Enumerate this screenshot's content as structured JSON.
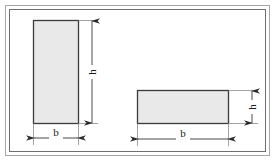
{
  "figure": {
    "frame": {
      "outer_border_color": "#9a9a9a",
      "inner_border_color": "#7d7d7d",
      "background_color": "#ffffff"
    },
    "colors": {
      "shape_fill": "#e9e9e9",
      "shape_stroke": "#3b3b3b",
      "dimension_line": "#4a4a4a",
      "label_text": "#1a1a1a"
    },
    "shapes": [
      {
        "name": "tall-rectangle",
        "x": 33,
        "y": 20,
        "width": 45,
        "height": 103,
        "width_label": "b",
        "height_label": "h"
      },
      {
        "name": "wide-rectangle",
        "x": 137,
        "y": 90,
        "width": 91,
        "height": 33,
        "width_label": "b",
        "height_label": "h"
      }
    ],
    "dimensions": [
      {
        "name": "tall-height",
        "label": "h",
        "orientation": "vertical",
        "x": 92,
        "y1": 20,
        "y2": 123
      },
      {
        "name": "tall-width",
        "label": "b",
        "orientation": "horizontal",
        "y": 138,
        "x1": 33,
        "x2": 78
      },
      {
        "name": "wide-height",
        "label": "h",
        "orientation": "vertical",
        "x": 252,
        "y1": 90,
        "y2": 123
      },
      {
        "name": "wide-width",
        "label": "b",
        "orientation": "horizontal",
        "y": 139,
        "x1": 137,
        "x2": 228
      }
    ]
  }
}
